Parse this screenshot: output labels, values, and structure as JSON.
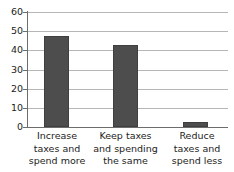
{
  "chart_data": {
    "type": "bar",
    "title": "",
    "subtitle": "",
    "xlabel": "",
    "ylabel": "",
    "categories": [
      "Increase taxes and spend more",
      "Keep taxes and spending the same",
      "Reduce taxes and spend less"
    ],
    "category_lines": [
      [
        "Increase",
        "taxes and",
        "spend more"
      ],
      [
        "Keep taxes",
        "and spending",
        "the same"
      ],
      [
        "Reduce",
        "taxes and",
        "spend less"
      ]
    ],
    "values": [
      47.5,
      43,
      2.5
    ],
    "ylim": [
      0,
      60
    ],
    "ytick_labels": [
      "0",
      "10",
      "20",
      "30",
      "40",
      "50",
      "60"
    ],
    "ytick_values": [
      0,
      10,
      20,
      30,
      40,
      50,
      60
    ],
    "grid": "horizontal",
    "legend": "none",
    "bar_color": "#4d4d4d",
    "gridline_color": "#b6b6b6",
    "axis_color": "#6d6d6d",
    "text_color": "#1c1c1c",
    "background_color": "#ffffff"
  }
}
